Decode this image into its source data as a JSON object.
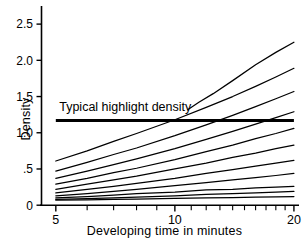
{
  "chart_data": {
    "type": "line",
    "title": "",
    "xlabel": "Developing time in minutes",
    "ylabel": "Density",
    "xscale": "log",
    "xlim": [
      4.6,
      20.6
    ],
    "ylim": [
      0,
      2.75
    ],
    "xticks_labeled": [
      "5",
      "10",
      "20"
    ],
    "xtick_values_labeled": [
      5,
      10,
      20
    ],
    "xticks_minor": [
      6,
      7,
      8,
      9,
      11,
      12,
      13,
      14,
      15,
      16,
      17,
      18,
      19
    ],
    "yticks_labeled": [
      "0",
      ".5",
      "1.0",
      "1.5",
      "2.0",
      "2.5"
    ],
    "ytick_values_labeled": [
      0,
      0.5,
      1.0,
      1.5,
      2.0,
      2.5
    ],
    "grid": false,
    "legend": "none",
    "annotations": [
      {
        "name": "typical-highlight-density",
        "text": "Typical highlight density",
        "type": "horizontal-reference-line",
        "y_value": 1.17,
        "x_from": 5,
        "x_to": 20,
        "linewidth_px": 3,
        "color": "#000000",
        "label_x": 5.1,
        "label_y": 1.3
      }
    ],
    "series": [
      {
        "name": "step-11",
        "x": [
          10.8,
          11.5,
          12.5,
          14,
          16,
          18,
          20
        ],
        "values": [
          1.32,
          1.42,
          1.54,
          1.72,
          1.94,
          2.11,
          2.25
        ]
      },
      {
        "name": "step-10",
        "x": [
          5,
          6,
          7,
          8,
          10,
          12,
          14,
          16,
          18,
          20
        ],
        "values": [
          0.61,
          0.75,
          0.88,
          0.99,
          1.18,
          1.35,
          1.5,
          1.64,
          1.77,
          1.89
        ]
      },
      {
        "name": "step-9",
        "x": [
          5,
          6,
          7,
          8,
          10,
          12,
          14,
          16,
          18,
          20
        ],
        "values": [
          0.47,
          0.59,
          0.7,
          0.79,
          0.96,
          1.11,
          1.24,
          1.36,
          1.47,
          1.57
        ]
      },
      {
        "name": "step-8",
        "x": [
          5,
          6,
          7,
          8,
          10,
          12,
          14,
          16,
          18,
          20
        ],
        "values": [
          0.37,
          0.47,
          0.56,
          0.64,
          0.78,
          0.91,
          1.02,
          1.12,
          1.21,
          1.29
        ]
      },
      {
        "name": "step-7",
        "x": [
          5,
          6,
          7,
          8,
          10,
          12,
          14,
          16,
          18,
          20
        ],
        "values": [
          0.29,
          0.37,
          0.45,
          0.51,
          0.63,
          0.74,
          0.83,
          0.92,
          0.99,
          1.06
        ]
      },
      {
        "name": "step-6",
        "x": [
          5,
          6,
          7,
          8,
          10,
          12,
          14,
          16,
          18,
          20
        ],
        "values": [
          0.22,
          0.29,
          0.35,
          0.4,
          0.5,
          0.58,
          0.66,
          0.72,
          0.78,
          0.83
        ]
      },
      {
        "name": "step-5",
        "x": [
          5,
          6,
          7,
          8,
          10,
          12,
          14,
          16,
          18,
          20
        ],
        "values": [
          0.17,
          0.22,
          0.26,
          0.3,
          0.37,
          0.44,
          0.49,
          0.54,
          0.58,
          0.62
        ]
      },
      {
        "name": "step-4",
        "x": [
          5,
          6,
          7,
          8,
          10,
          12,
          14,
          16,
          18,
          20
        ],
        "values": [
          0.13,
          0.16,
          0.19,
          0.22,
          0.27,
          0.31,
          0.35,
          0.38,
          0.41,
          0.44
        ]
      },
      {
        "name": "step-3",
        "x": [
          5,
          6,
          7,
          8,
          10,
          12,
          14,
          16,
          18,
          20
        ],
        "values": [
          0.1,
          0.12,
          0.14,
          0.16,
          0.18,
          0.21,
          0.22,
          0.24,
          0.25,
          0.26
        ]
      },
      {
        "name": "step-2",
        "x": [
          5,
          6,
          7,
          8,
          10,
          12,
          14,
          16,
          18,
          20
        ],
        "values": [
          0.08,
          0.09,
          0.1,
          0.11,
          0.13,
          0.15,
          0.16,
          0.17,
          0.18,
          0.19
        ]
      },
      {
        "name": "step-1",
        "x": [
          5,
          6,
          7,
          8,
          10,
          12,
          14,
          16,
          18,
          20
        ],
        "values": [
          0.07,
          0.075,
          0.08,
          0.085,
          0.095,
          0.1,
          0.105,
          0.11,
          0.115,
          0.12
        ]
      }
    ]
  },
  "axis": {
    "y_title": "Density",
    "x_title": "Developing time in minutes"
  },
  "colors": {
    "line": "#000000",
    "axis": "#000000",
    "background": "#ffffff"
  }
}
